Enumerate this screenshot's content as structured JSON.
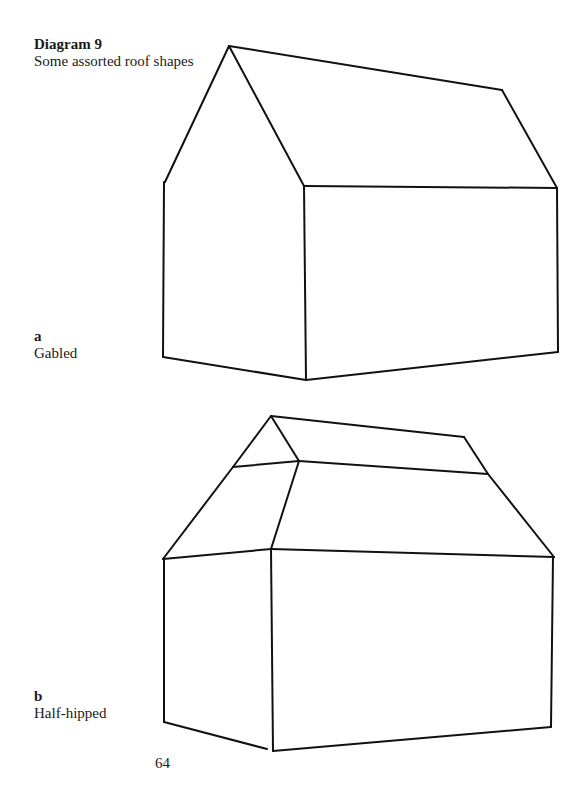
{
  "title": {
    "label": "Diagram 9",
    "subtitle": "Some assorted roof shapes"
  },
  "figures": [
    {
      "letter": "a",
      "name": "Gabled"
    },
    {
      "letter": "b",
      "name": "Half-hipped"
    }
  ],
  "page_number": "64"
}
